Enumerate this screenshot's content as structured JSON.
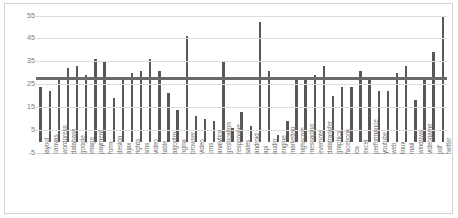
{
  "chart_data": {
    "type": "bar",
    "title": "",
    "subtitle": "",
    "xlabel": "",
    "ylabel": "",
    "ylim": [
      -5,
      57
    ],
    "yticks": [
      55,
      45,
      35,
      25,
      15,
      5,
      -5
    ],
    "ytick_labels": [
      "55",
      "45",
      "35",
      "25",
      "15",
      "5",
      "-5"
    ],
    "grid": true,
    "legend_position": "none",
    "bar_color": "#595857",
    "reference_line": {
      "label": "",
      "value": 28,
      "color": "#6a6a69"
    },
    "categories": [
      "layout",
      "canvas",
      "wordpress",
      "database",
      "google",
      "image",
      "payment",
      "form",
      "design",
      "ajax",
      "rights",
      "sms",
      "video",
      "table",
      "algoritm",
      "nginx",
      "browser",
      "video",
      "cms",
      "analytics",
      "geolocation",
      "responsive",
      "sales",
      "android",
      "api",
      "audio",
      "engine",
      "marketing",
      "highscore",
      "messaging",
      "evernote",
      "datatransfer",
      "graphics",
      "facebook",
      "ios",
      "excel",
      "performance",
      "youtube",
      "web",
      "linux",
      "mail",
      "windows",
      "videogame",
      "pdf",
      "twitter"
    ],
    "values": [
      24,
      22,
      28,
      32,
      33,
      29,
      36,
      35,
      19,
      27,
      30,
      31,
      36,
      31,
      21,
      14,
      46,
      11,
      10,
      9,
      35,
      6,
      13,
      7,
      52,
      31,
      3,
      9,
      28,
      28,
      29,
      33,
      20,
      24,
      24,
      31,
      28,
      22,
      22,
      30,
      33,
      18,
      27,
      39,
      55
    ],
    "series": [
      {
        "name": "values",
        "values": [
          24,
          22,
          28,
          32,
          33,
          29,
          36,
          35,
          19,
          27,
          30,
          31,
          36,
          31,
          21,
          14,
          46,
          11,
          10,
          9,
          35,
          6,
          13,
          7,
          52,
          31,
          3,
          9,
          28,
          28,
          29,
          33,
          20,
          24,
          24,
          31,
          28,
          22,
          22,
          30,
          33,
          18,
          27,
          39,
          55
        ]
      }
    ]
  }
}
